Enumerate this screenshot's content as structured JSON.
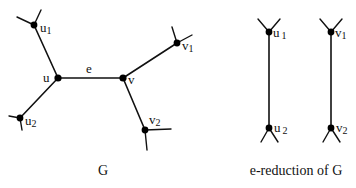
{
  "graph_g": {
    "caption": "G",
    "edge_label": "e",
    "nodes": {
      "u": {
        "label": "u",
        "sub": ""
      },
      "u1": {
        "label": "u",
        "sub": "1"
      },
      "u2": {
        "label": "u",
        "sub": "2"
      },
      "v": {
        "label": "v",
        "sub": ""
      },
      "v1": {
        "label": "v",
        "sub": "1"
      },
      "v2": {
        "label": "v",
        "sub": "2"
      }
    }
  },
  "graph_reduction": {
    "caption": "e-reduction of G",
    "nodes": {
      "u1": {
        "label": "u",
        "sub": "1"
      },
      "u2": {
        "label": "u",
        "sub": "2"
      },
      "v1": {
        "label": "v",
        "sub": "1"
      },
      "v2": {
        "label": "v",
        "sub": "2"
      }
    }
  },
  "colors": {
    "ink": "#111111",
    "background": "#ffffff"
  }
}
